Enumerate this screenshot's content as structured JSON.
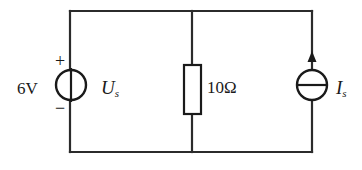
{
  "figure": {
    "type": "circuit-schematic",
    "background_color": "#ffffff",
    "line_color": "#2b2b2b",
    "text_color": "#1a1a1a"
  },
  "labels": {
    "source_voltage": "6V",
    "voltage_source_symbol": "U",
    "voltage_source_subscript": "s",
    "resistance": "10Ω",
    "current_source_symbol": "I",
    "current_source_subscript": "s",
    "polarity_positive": "+",
    "polarity_negative": "−"
  },
  "components": [
    {
      "name": "voltage-source",
      "kind": "ideal-voltage-source",
      "value": "6V",
      "symbol_label": "Us",
      "polarity_top": "+",
      "polarity_bottom": "−",
      "position": {
        "cx": 71,
        "cy": 85,
        "r": 15
      }
    },
    {
      "name": "resistor",
      "kind": "resistor",
      "value": "10Ω",
      "position": {
        "x": 184,
        "y": 65,
        "width": 17,
        "height": 49
      }
    },
    {
      "name": "current-source",
      "kind": "ideal-current-source",
      "symbol_label": "Is",
      "arrow_direction": "up",
      "position": {
        "cx": 312,
        "cy": 85,
        "r": 15
      }
    }
  ],
  "wires": {
    "top_y": 11,
    "bottom_y": 152,
    "left_x": 70,
    "middle_x": 192,
    "right_x": 312
  }
}
